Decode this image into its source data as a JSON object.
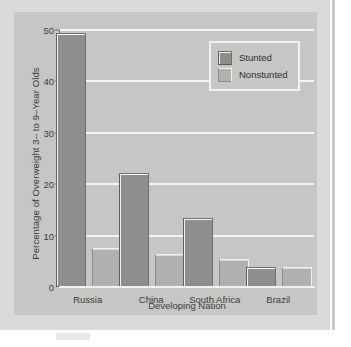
{
  "chart_data": {
    "type": "bar",
    "title": "",
    "xlabel": "Developing Nation",
    "ylabel": "Percentage of Overweight 3– to 9–Year Olds",
    "categories": [
      "Russia",
      "China",
      "South Africa",
      "Brazil"
    ],
    "series": [
      {
        "name": "Stunted",
        "values": [
          49.0,
          21.7,
          13.0,
          3.5
        ],
        "color": "#8e8e8c"
      },
      {
        "name": "Nonstunted",
        "values": [
          7.2,
          6.1,
          5.0,
          3.6
        ],
        "color": "#b0b0ae"
      }
    ],
    "ylim": [
      0,
      50
    ],
    "yticks": [
      0,
      10,
      20,
      30,
      40,
      50
    ],
    "ytick_labels": [
      "0",
      "10",
      "20",
      "30",
      "40",
      "50"
    ],
    "grid": true,
    "grid_color": "#f4f4f2",
    "legend_position": "top-right",
    "panel_background": "#c6c6c4"
  },
  "legend": {
    "entries": [
      {
        "label": "Stunted"
      },
      {
        "label": "Nonstunted"
      }
    ]
  }
}
